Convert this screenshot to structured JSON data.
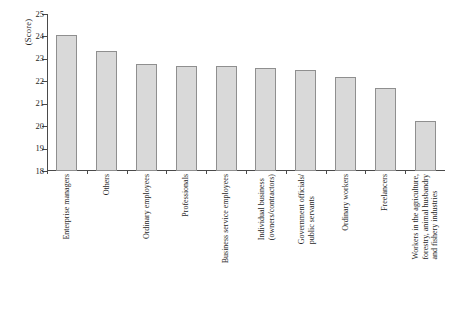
{
  "chart_data": {
    "type": "bar",
    "title": "",
    "subtitle": "",
    "xlabel": "",
    "ylabel": "(Score)",
    "ylim": [
      18,
      25
    ],
    "yticks": [
      18,
      19,
      20,
      21,
      22,
      23,
      24,
      25
    ],
    "grid": false,
    "legend": null,
    "orientation": "vertical",
    "bar_color": "#d9d9d9",
    "bar_edge_color": "#8f8f8f",
    "axis_color": "#4a4a4a",
    "categories": [
      "Enterprise managers",
      "Others",
      "Ordinary employees",
      "Professionals",
      "Business service employees",
      "Individual business (owners/contractors)",
      "Government officials/ public servants",
      "Ordinary workers",
      "Freelancers",
      "Workers in the agriculture, forestry, animal husbandry and fishery industries"
    ],
    "category_lines": [
      [
        "Enterprise managers"
      ],
      [
        "Others"
      ],
      [
        "Ordinary employees"
      ],
      [
        "Professionals"
      ],
      [
        "Business service employees"
      ],
      [
        "Individual business",
        "(owners/contractors)"
      ],
      [
        "Government officials/",
        "public servants"
      ],
      [
        "Ordinary workers"
      ],
      [
        "Freelancers"
      ],
      [
        "Workers in the agriculture,",
        "forestry, animal husbandry",
        "and fishery industries"
      ]
    ],
    "values": [
      24.05,
      23.33,
      22.78,
      22.67,
      22.67,
      22.6,
      22.52,
      22.2,
      21.7,
      20.25
    ]
  }
}
